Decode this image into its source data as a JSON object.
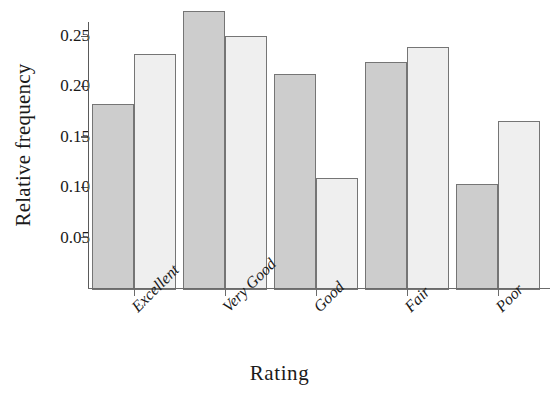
{
  "chart_data": {
    "type": "bar",
    "title": "",
    "xlabel": "Rating",
    "ylabel": "Relative frequency",
    "categories": [
      "Excellent",
      "Very Good",
      "Good",
      "Fair",
      "Poor"
    ],
    "series": [
      {
        "name": "Series A",
        "color": "#cdcdcd",
        "values": [
          0.185,
          0.277,
          0.214,
          0.226,
          0.105
        ]
      },
      {
        "name": "Series B",
        "color": "#efefef",
        "values": [
          0.234,
          0.252,
          0.111,
          0.241,
          0.168
        ]
      }
    ],
    "ylim": [
      0,
      0.2775
    ],
    "yticks": [
      0.05,
      0.1,
      0.15,
      0.2,
      0.25
    ],
    "ytick_labels": [
      "0.05",
      "0.10",
      "0.15",
      "0.20",
      "0.25"
    ],
    "grid": false,
    "legend": "none",
    "xtick_rotation": -45,
    "bar_edge_color": "#757575"
  }
}
